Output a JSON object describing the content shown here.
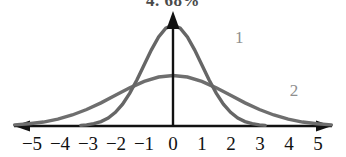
{
  "heading": {
    "text": "4. 68%"
  },
  "axis": {
    "tick_labels": [
      "−5",
      "−4",
      "−3",
      "−2",
      "−1",
      "0",
      "1",
      "2",
      "3",
      "4",
      "5"
    ],
    "line_color": "#111111",
    "left_arrow": "arrow-left",
    "right_arrow": "arrow-right",
    "y_axis_arrow": "arrow-up"
  },
  "curves": [
    {
      "label": "1",
      "color": "#666666",
      "mean": 0,
      "sigma": 1,
      "peak_height": 1.0
    },
    {
      "label": "2",
      "color": "#6e6e6e",
      "mean": 0,
      "sigma": 2,
      "peak_height": 0.5
    }
  ],
  "chart_data": {
    "type": "line",
    "title": "4. 68%",
    "xlabel": "",
    "ylabel": "",
    "xlim": [
      -5.6,
      5.6
    ],
    "ylim": [
      0,
      1.15
    ],
    "grid": false,
    "legend": "inline-curve-labels",
    "x_ticks": [
      -5,
      -4,
      -3,
      -2,
      -1,
      0,
      1,
      2,
      3,
      4,
      5
    ],
    "x_tick_labels": [
      "−5",
      "−4",
      "−3",
      "−2",
      "−1",
      "0",
      "1",
      "2",
      "3",
      "4",
      "5"
    ],
    "series": [
      {
        "name": "1",
        "description": "Tall narrow normal curve, mean 0, sigma 1",
        "color": "#666666",
        "x": [
          -3.2,
          -3.0,
          -2.75,
          -2.5,
          -2.25,
          -2.0,
          -1.75,
          -1.5,
          -1.25,
          -1.0,
          -0.75,
          -0.5,
          -0.25,
          0,
          0.25,
          0.5,
          0.75,
          1.0,
          1.25,
          1.5,
          1.75,
          2.0,
          2.25,
          2.5,
          2.75,
          3.0,
          3.2
        ],
        "values": [
          0.006,
          0.011,
          0.024,
          0.044,
          0.079,
          0.135,
          0.216,
          0.325,
          0.458,
          0.607,
          0.754,
          0.882,
          0.969,
          1.0,
          0.969,
          0.882,
          0.754,
          0.607,
          0.458,
          0.325,
          0.216,
          0.135,
          0.079,
          0.044,
          0.024,
          0.011,
          0.006
        ]
      },
      {
        "name": "2",
        "description": "Short wide normal curve, mean 0, sigma 2",
        "color": "#6e6e6e",
        "x": [
          -5.5,
          -5.0,
          -4.5,
          -4.0,
          -3.5,
          -3.0,
          -2.5,
          -2.0,
          -1.5,
          -1.0,
          -0.5,
          0,
          0.5,
          1.0,
          1.5,
          2.0,
          2.5,
          3.0,
          3.5,
          4.0,
          4.5,
          5.0,
          5.5
        ],
        "values": [
          0.011,
          0.022,
          0.039,
          0.068,
          0.109,
          0.163,
          0.229,
          0.304,
          0.378,
          0.441,
          0.485,
          0.5,
          0.485,
          0.441,
          0.378,
          0.304,
          0.229,
          0.163,
          0.109,
          0.068,
          0.039,
          0.022,
          0.011
        ]
      }
    ],
    "annotations": [
      {
        "text": "1",
        "x": 2.3,
        "y": 0.82,
        "color": "#8e8e8e"
      },
      {
        "text": "2",
        "x": 4.2,
        "y": 0.3,
        "color": "#8e8e8e"
      }
    ],
    "intersections": [
      {
        "x": -1.7,
        "y": 0.235
      },
      {
        "x": 1.7,
        "y": 0.235
      }
    ]
  }
}
